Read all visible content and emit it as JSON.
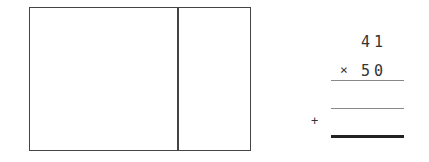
{
  "area_model": {
    "left_region": "",
    "right_region": ""
  },
  "multiplication": {
    "multiplicand": "41",
    "operator": "×",
    "multiplier": "50",
    "partial_sum_operator": "+"
  }
}
